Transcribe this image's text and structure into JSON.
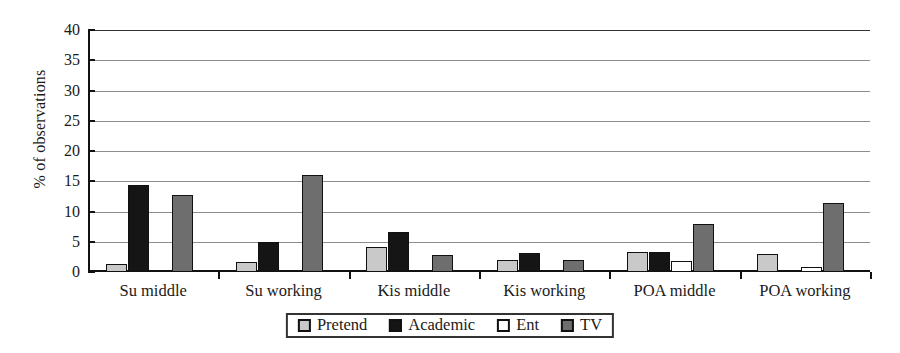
{
  "chart_data": {
    "type": "bar",
    "title": "",
    "xlabel": "",
    "ylabel": "% of observations",
    "ylim": [
      0,
      40
    ],
    "yticks": [
      0,
      5,
      10,
      15,
      20,
      25,
      30,
      35,
      40
    ],
    "grid": true,
    "legend_position": "bottom-center",
    "categories": [
      "Su middle",
      "Su working",
      "Kis middle",
      "Kis working",
      "POA middle",
      "POA working"
    ],
    "series": [
      {
        "name": "Pretend",
        "color": "#c9c9c9",
        "values": [
          1.3,
          1.7,
          4.1,
          2.0,
          3.3,
          3.0
        ]
      },
      {
        "name": "Academic",
        "color": "#151515",
        "values": [
          14.4,
          5.0,
          6.6,
          3.1,
          3.3,
          0.3
        ]
      },
      {
        "name": "Ent",
        "color": "#ffffff",
        "values": [
          0.0,
          0.3,
          0.0,
          0.3,
          1.8,
          0.9
        ]
      },
      {
        "name": "TV",
        "color": "#6e6e6e",
        "values": [
          12.8,
          16.0,
          2.8,
          2.0,
          7.9,
          11.4
        ]
      }
    ]
  },
  "axis": {
    "y_title": "% of observations"
  },
  "legend": {
    "items": [
      {
        "label": "Pretend",
        "key": "pretend"
      },
      {
        "label": "Academic",
        "key": "academic"
      },
      {
        "label": "Ent",
        "key": "ent"
      },
      {
        "label": "TV",
        "key": "tv"
      }
    ]
  }
}
